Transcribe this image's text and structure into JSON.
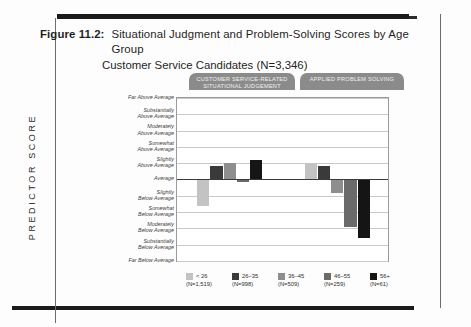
{
  "figure": {
    "number_label": "Figure 11.2:",
    "title_line1": "Situational Judgment and Problem-Solving Scores by Age Group",
    "title_line2": "Customer Service Candidates (N=3,346)"
  },
  "axis": {
    "y_title": "PREDICTOR SCORE"
  },
  "groups": [
    {
      "id": "situational-judgement",
      "label": "CUSTOMER SERVICE-RELATED SITUATIONAL JUDGEMENT"
    },
    {
      "id": "applied-problem-solving",
      "label": "APPLIED PROBLEM SOLVING"
    }
  ],
  "legend": [
    {
      "label": "< 26",
      "n": "(N=1,519)",
      "color": "#c3c3c3"
    },
    {
      "label": "26–35",
      "n": "(N=998)",
      "color": "#3a3a3a"
    },
    {
      "label": "36–45",
      "n": "(N=509)",
      "color": "#8e8e8e"
    },
    {
      "label": "46–55",
      "n": "(N=259)",
      "color": "#6a6a6a"
    },
    {
      "label": "56+",
      "n": "(N=61)",
      "color": "#151515"
    }
  ],
  "colors": {
    "bar_lt26": "#c3c3c3",
    "bar_26_35": "#3a3a3a",
    "bar_36_45": "#8e8e8e",
    "bar_46_55": "#6a6a6a",
    "bar_56plus": "#151515",
    "pill": "#8b8b8b",
    "gridline": "#c9c9c9",
    "zeroline": "#3a3a3a",
    "frame": "#9a9a9a"
  },
  "chart_data": {
    "type": "bar",
    "xlabel": "",
    "ylabel": "PREDICTOR SCORE",
    "grid": true,
    "legend_position": "bottom",
    "ylim": [
      -5,
      5
    ],
    "ytick_values": [
      5,
      4,
      3,
      2,
      1,
      0,
      -1,
      -2,
      -3,
      -4,
      -5
    ],
    "ytick_labels": [
      "Far Above Average",
      "Substantially\nAbove Average",
      "Moderately\nAbove Average",
      "Somewhat\nAbove Average",
      "Slightly\nAbove Average",
      "Average",
      "Slightly\nBelow Average",
      "Somewhat\nBelow Average",
      "Moderately\nBelow Average",
      "Substantially\nBelow Average",
      "Far Below Average"
    ],
    "categories": [
      "CUSTOMER SERVICE-RELATED SITUATIONAL JUDGEMENT",
      "APPLIED PROBLEM SOLVING"
    ],
    "series": [
      {
        "name": "< 26 (N=1,519)",
        "color": "#c3c3c3",
        "values": [
          -1.6,
          1.0
        ]
      },
      {
        "name": "26–35 (N=998)",
        "color": "#3a3a3a",
        "values": [
          0.8,
          0.85
        ]
      },
      {
        "name": "36–45 (N=509)",
        "color": "#8e8e8e",
        "values": [
          1.0,
          -0.8
        ]
      },
      {
        "name": "46–55 (N=259)",
        "color": "#6a6a6a",
        "values": [
          -0.15,
          -2.9
        ]
      },
      {
        "name": "56+ (N=61)",
        "color": "#151515",
        "values": [
          1.2,
          -3.6
        ]
      }
    ]
  }
}
